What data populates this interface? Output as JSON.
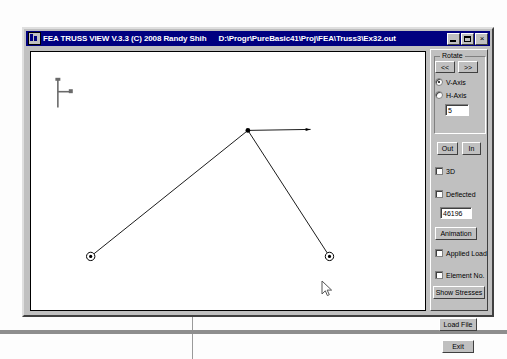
{
  "window": {
    "title": "FEA TRUSS VIEW V.3.3 (C) 2008 Randy Shih",
    "file_path": "D:\\Progr\\PureBasic41\\Proj\\FEA\\Truss3\\Ex32.out",
    "icon": "app-icon",
    "buttons": {
      "minimize": "minimize-icon",
      "maximize": "maximize-icon",
      "close": "×"
    }
  },
  "canvas": {
    "axis_indicator": "axis-origin-icon",
    "background_color": "#ffffff",
    "line_color": "#000000"
  },
  "panel": {
    "rotate_group": {
      "title": "Rotate",
      "prev_label": "<<",
      "next_label": ">>",
      "axis_options": [
        {
          "label": "V-Axis",
          "selected": true
        },
        {
          "label": "H-Axis",
          "selected": false
        }
      ],
      "step_value": "5"
    },
    "zoom": {
      "out_label": "Out",
      "in_label": "In"
    },
    "checkboxes": [
      {
        "label": "3D",
        "checked": false
      },
      {
        "label": "Deflected",
        "checked": false
      },
      {
        "label": "Applied Load",
        "checked": false
      },
      {
        "label": "Element No.",
        "checked": false
      }
    ],
    "deflection_scale": "46196",
    "animation_label": "Animation",
    "show_stresses_label": "Show Stresses",
    "load_file_label": "Load File",
    "exit_label": "Exit"
  },
  "truss_model": {
    "nodes": [
      {
        "id": 1,
        "x": 82,
        "y": 228,
        "type": "support"
      },
      {
        "id": 2,
        "x": 240,
        "y": 101,
        "type": "joint"
      },
      {
        "id": 3,
        "x": 322,
        "y": 228,
        "type": "support"
      }
    ],
    "members": [
      {
        "from": 1,
        "to": 2
      },
      {
        "from": 2,
        "to": 3
      }
    ],
    "load_arrow": {
      "x1": 240,
      "y1": 101,
      "x2": 303,
      "y2": 100,
      "direction": "horizontal-right"
    }
  },
  "colors": {
    "title_bar": "#000080",
    "window_face": "#c0c0c0",
    "canvas": "#ffffff",
    "text": "#000000"
  }
}
